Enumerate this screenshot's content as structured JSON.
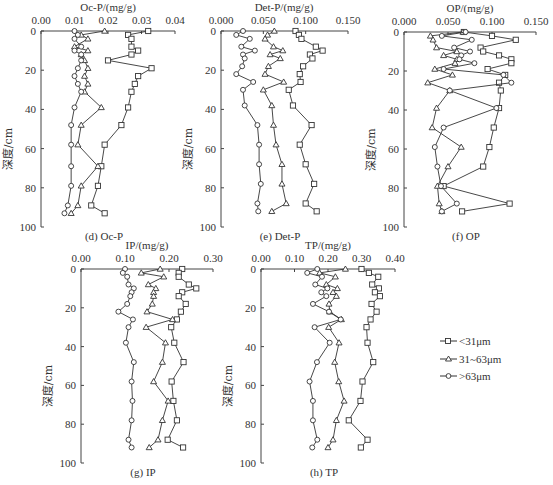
{
  "figure": {
    "legend": [
      {
        "label": "<31μm",
        "marker": "square"
      },
      {
        "label": "31~63μm",
        "marker": "triangle"
      },
      {
        "label": ">63μm",
        "marker": "circle"
      }
    ],
    "ylabel": "深度/cm"
  },
  "chart_data": [
    {
      "id": "d",
      "type": "line",
      "title": "Oc-P/(mg/g)",
      "caption": "(d) Oc-P",
      "xlabel": "Oc-P/(mg/g)",
      "ylabel": "深度/cm",
      "xlim": [
        0,
        0.04
      ],
      "ylim": [
        0,
        100
      ],
      "y_inverted": true,
      "xticks": [
        "0.00",
        "0.01",
        "0.02",
        "0.03",
        "0.04"
      ],
      "yticks": [
        "0",
        "20",
        "40",
        "60",
        "80",
        "100"
      ],
      "depth": [
        0,
        2,
        4,
        8,
        10,
        12,
        15,
        19,
        23,
        27,
        31,
        39,
        48,
        58,
        69,
        79,
        89,
        93
      ],
      "series": [
        {
          "name": "<31μm",
          "marker": "square",
          "values": [
            0.032,
            0.026,
            0.027,
            0.027,
            0.029,
            0.027,
            0.02,
            0.033,
            0.029,
            0.028,
            0.027,
            0.026,
            0.024,
            0.019,
            0.018,
            0.017,
            0.015,
            0.019
          ]
        },
        {
          "name": "31~63μm",
          "marker": "triangle",
          "values": [
            0.019,
            0.012,
            0.014,
            0.01,
            0.014,
            0.012,
            0.013,
            0.014,
            0.013,
            0.014,
            0.013,
            0.018,
            0.012,
            0.011,
            0.017,
            0.012,
            0.011,
            0.009
          ]
        },
        {
          "name": ">63μm",
          "marker": "circle",
          "values": [
            0.01,
            0.011,
            0.01,
            0.012,
            0.01,
            0.012,
            0.012,
            0.011,
            0.01,
            0.011,
            0.012,
            0.01,
            0.009,
            0.009,
            0.009,
            0.009,
            0.008,
            0.007
          ]
        }
      ]
    },
    {
      "id": "e",
      "type": "line",
      "title": "Det-P/(mg/g)",
      "caption": "(e) Det-P",
      "xlabel": "Det-P/(mg/g)",
      "ylabel": "深度/cm",
      "xlim": [
        0,
        0.15
      ],
      "ylim": [
        0,
        100
      ],
      "y_inverted": true,
      "xticks": [
        "0.000",
        "0.050",
        "0.100",
        "0.150"
      ],
      "yticks": [
        "0",
        "20",
        "40",
        "60",
        "80",
        "100"
      ],
      "depth": [
        0,
        2,
        4,
        8,
        10,
        12,
        14,
        18,
        22,
        26,
        30,
        38,
        48,
        58,
        68,
        78,
        88,
        92
      ],
      "series": [
        {
          "name": "<31μm",
          "marker": "square",
          "values": [
            0.088,
            0.092,
            0.095,
            0.112,
            0.12,
            0.105,
            0.108,
            0.097,
            0.093,
            0.094,
            0.08,
            0.085,
            0.107,
            0.093,
            0.1,
            0.11,
            0.1,
            0.113
          ]
        },
        {
          "name": "31~63μm",
          "marker": "triangle",
          "values": [
            0.063,
            0.055,
            0.052,
            0.062,
            0.073,
            0.058,
            0.07,
            0.056,
            0.052,
            0.074,
            0.05,
            0.06,
            0.062,
            0.065,
            0.072,
            0.072,
            0.077,
            0.06
          ]
        },
        {
          "name": ">63μm",
          "marker": "circle",
          "values": [
            0.026,
            0.018,
            0.034,
            0.024,
            0.04,
            0.026,
            0.028,
            0.025,
            0.018,
            0.038,
            0.026,
            0.028,
            0.043,
            0.045,
            0.045,
            0.047,
            0.043,
            0.044
          ]
        }
      ]
    },
    {
      "id": "f",
      "type": "line",
      "title": "OP/(mg/g)",
      "caption": "(f) OP",
      "xlabel": "OP/(mg/g)",
      "ylabel": "深度/cm",
      "xlim": [
        0,
        0.15
      ],
      "ylim": [
        0,
        100
      ],
      "y_inverted": true,
      "xticks": [
        "0.000",
        "0.050",
        "0.100",
        "0.150"
      ],
      "yticks": [
        "0",
        "20",
        "40",
        "60",
        "80",
        "100"
      ],
      "depth": [
        0,
        2,
        4,
        8,
        10,
        12,
        14,
        16,
        19,
        22,
        26,
        30,
        39,
        49,
        59,
        69,
        79,
        88,
        92
      ],
      "series": [
        {
          "name": "<31μm",
          "marker": "square",
          "values": [
            0.068,
            0.1,
            0.127,
            0.087,
            0.09,
            0.108,
            0.122,
            0.122,
            0.095,
            0.115,
            0.108,
            0.11,
            0.108,
            0.102,
            0.097,
            0.09,
            0.045,
            0.12,
            0.066
          ]
        },
        {
          "name": "31~63μm",
          "marker": "triangle",
          "values": [
            0.067,
            0.03,
            0.033,
            0.037,
            0.06,
            0.045,
            0.06,
            0.058,
            0.035,
            0.055,
            0.027,
            0.052,
            0.037,
            0.032,
            0.065,
            0.05,
            0.038,
            0.04,
            0.043
          ]
        },
        {
          "name": ">63μm",
          "marker": "circle",
          "values": [
            0.07,
            0.043,
            0.077,
            0.057,
            0.075,
            0.065,
            0.063,
            0.08,
            0.045,
            0.113,
            0.122,
            0.052,
            0.105,
            0.045,
            0.035,
            0.038,
            0.042,
            0.06,
            0.043
          ]
        }
      ]
    },
    {
      "id": "g",
      "type": "line",
      "title": "IP/(mg/g)",
      "caption": "(g) IP",
      "xlabel": "IP/(mg/g)",
      "ylabel": "深度/cm",
      "xlim": [
        0,
        0.3
      ],
      "ylim": [
        0,
        100
      ],
      "y_inverted": true,
      "xticks": [
        "0.00",
        "0.10",
        "0.20",
        "0.30"
      ],
      "yticks": [
        "0",
        "20",
        "40",
        "60",
        "80",
        "100"
      ],
      "depth": [
        0,
        2,
        4,
        8,
        10,
        12,
        14,
        18,
        22,
        26,
        30,
        38,
        48,
        58,
        68,
        78,
        88,
        92
      ],
      "series": [
        {
          "name": "<31μm",
          "marker": "square",
          "values": [
            0.23,
            0.222,
            0.222,
            0.245,
            0.262,
            0.23,
            0.222,
            0.238,
            0.227,
            0.218,
            0.205,
            0.212,
            0.233,
            0.206,
            0.21,
            0.218,
            0.197,
            0.232
          ]
        },
        {
          "name": "31~63μm",
          "marker": "triangle",
          "values": [
            0.18,
            0.137,
            0.188,
            0.153,
            0.17,
            0.165,
            0.165,
            0.162,
            0.15,
            0.208,
            0.148,
            0.192,
            0.185,
            0.165,
            0.198,
            0.185,
            0.175,
            0.155
          ]
        },
        {
          "name": ">63μm",
          "marker": "circle",
          "values": [
            0.1,
            0.095,
            0.105,
            0.108,
            0.12,
            0.115,
            0.112,
            0.105,
            0.085,
            0.118,
            0.108,
            0.102,
            0.12,
            0.115,
            0.117,
            0.115,
            0.108,
            0.115
          ]
        }
      ]
    },
    {
      "id": "h",
      "type": "line",
      "title": "TP/(mg/g)",
      "caption": "(h) TP",
      "xlabel": "TP/(mg/g)",
      "ylabel": "深度/cm",
      "xlim": [
        0,
        0.4
      ],
      "ylim": [
        0,
        100
      ],
      "y_inverted": true,
      "xticks": [
        "0.00",
        "0.10",
        "0.20",
        "0.30",
        "0.40"
      ],
      "yticks": [
        "0",
        "20",
        "40",
        "60",
        "80",
        "100"
      ],
      "depth": [
        0,
        2,
        4,
        8,
        10,
        12,
        14,
        18,
        22,
        26,
        30,
        38,
        48,
        58,
        68,
        78,
        88,
        92
      ],
      "series": [
        {
          "name": "<31μm",
          "marker": "square",
          "values": [
            0.3,
            0.322,
            0.35,
            0.332,
            0.352,
            0.34,
            0.355,
            0.33,
            0.345,
            0.327,
            0.315,
            0.318,
            0.335,
            0.303,
            0.297,
            0.262,
            0.318,
            0.298
          ]
        },
        {
          "name": "31~63μm",
          "marker": "triangle",
          "values": [
            0.252,
            0.175,
            0.222,
            0.195,
            0.228,
            0.215,
            0.225,
            0.203,
            0.205,
            0.24,
            0.202,
            0.233,
            0.22,
            0.232,
            0.248,
            0.225,
            0.215,
            0.2
          ]
        },
        {
          "name": ">63μm",
          "marker": "circle",
          "values": [
            0.168,
            0.138,
            0.182,
            0.162,
            0.198,
            0.18,
            0.195,
            0.155,
            0.203,
            0.238,
            0.16,
            0.205,
            0.167,
            0.145,
            0.155,
            0.155,
            0.168,
            0.153
          ]
        }
      ]
    }
  ]
}
